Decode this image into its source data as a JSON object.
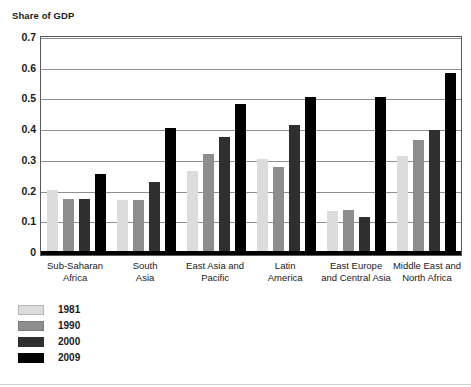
{
  "chart_data": {
    "type": "bar",
    "title": "Share of GDP",
    "xlabel": "",
    "ylabel": "Share of GDP",
    "ylim": [
      0,
      0.7
    ],
    "ytick_labels": [
      "0.7",
      "0.6",
      "0.5",
      "0.4",
      "0.3",
      "0.2",
      "0.1",
      "0"
    ],
    "ytick_values": [
      0.7,
      0.6,
      0.5,
      0.4,
      0.3,
      0.2,
      0.1,
      0
    ],
    "grid": true,
    "legend_position": "bottom-left",
    "categories": [
      "Sub-Saharan Africa",
      "South Asia",
      "East Asia and Pacific",
      "Latin America",
      "East Europe and Central Asia",
      "Middle East and North Africa"
    ],
    "category_lines": [
      [
        "Sub-Saharan",
        "Africa"
      ],
      [
        "South",
        "Asia"
      ],
      [
        "East Asia and",
        "Pacific"
      ],
      [
        "Latin",
        "America"
      ],
      [
        "East Europe",
        "and Central Asia"
      ],
      [
        "Middle East and",
        "North Africa"
      ]
    ],
    "series": [
      {
        "name": "1981",
        "color": "#dcdcdc",
        "values": [
          0.2,
          0.165,
          0.26,
          0.3,
          0.13,
          0.31
        ]
      },
      {
        "name": "1990",
        "color": "#8c8d8f",
        "values": [
          0.17,
          0.165,
          0.315,
          0.275,
          0.135,
          0.36
        ]
      },
      {
        "name": "2000",
        "color": "#2f2f2f",
        "values": [
          0.17,
          0.225,
          0.37,
          0.41,
          0.11,
          0.395
        ]
      },
      {
        "name": "2009",
        "color": "#000000",
        "values": [
          0.25,
          0.4,
          0.48,
          0.5,
          0.5,
          0.58
        ]
      }
    ]
  },
  "legend": {
    "items": [
      {
        "label": "1981",
        "swatch": "legend-swatch-1981"
      },
      {
        "label": "1990",
        "swatch": "legend-swatch-1990"
      },
      {
        "label": "2000",
        "swatch": "legend-swatch-2000"
      },
      {
        "label": "2009",
        "swatch": "legend-swatch-2009"
      }
    ]
  }
}
